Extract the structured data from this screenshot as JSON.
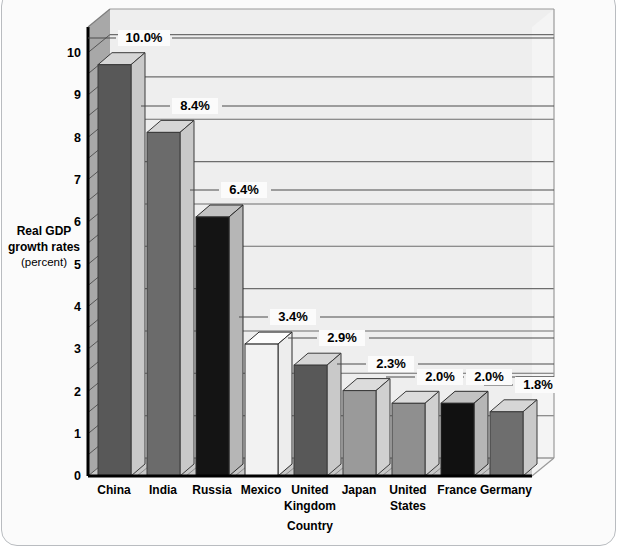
{
  "chart_data": {
    "type": "bar",
    "title": "",
    "subtitle": "",
    "xlabel": "Country",
    "ylabel": "Real GDP growth rates (percent)",
    "ylabel_main": "Real GDP growth rates",
    "ylabel_unit": "(percent)",
    "categories": [
      "China",
      "India",
      "Russia",
      "Mexico",
      "United Kingdom",
      "Japan",
      "United States",
      "France",
      "Germany"
    ],
    "values": [
      10.0,
      8.4,
      6.4,
      3.4,
      2.9,
      2.3,
      2.0,
      2.0,
      1.8
    ],
    "data_labels": [
      "10.0%",
      "8.4%",
      "6.4%",
      "3.4%",
      "2.9%",
      "2.3%",
      "2.0%",
      "2.0%",
      "1.8%"
    ],
    "ylim": [
      0,
      10.6
    ],
    "yticks": [
      0,
      1,
      2,
      3,
      4,
      5,
      6,
      7,
      8,
      9,
      10
    ],
    "ytick_labels": [
      "0",
      "1",
      "2",
      "3",
      "4",
      "5",
      "6",
      "7",
      "8",
      "9",
      "10"
    ],
    "minor_gridline_step": 0.5,
    "grid": true,
    "legend": null,
    "legend_position": "none",
    "style": "3d-bar",
    "bar_face_colors": [
      "#585858",
      "#6b6b6b",
      "#141414",
      "#f2f2f2",
      "#585858",
      "#9a9a9a",
      "#8f8f8f",
      "#111111",
      "#6e6e6e"
    ],
    "bar_top_color": "#d3d3d3",
    "bar_side_color": "#cccccc",
    "plot_background": "#f4f4f4",
    "wall_color": "#e9e9e9",
    "floor_color": "#c9c9c9",
    "left_wall_color": "#a6a6a6",
    "gridline_color": "#6f6f6f",
    "axis_color": "#000000",
    "frame_border_color": "#b9bcc0"
  },
  "x_tick_lines": [
    [
      "China"
    ],
    [
      "India"
    ],
    [
      "Russia"
    ],
    [
      "Mexico"
    ],
    [
      "United",
      "Kingdom"
    ],
    [
      "Japan"
    ],
    [
      "United",
      "States"
    ],
    [
      "France"
    ],
    [
      "Germany"
    ]
  ]
}
